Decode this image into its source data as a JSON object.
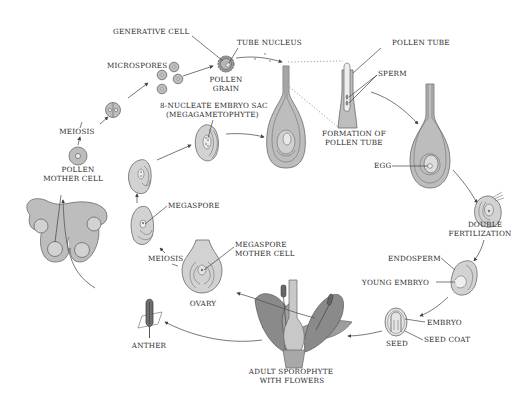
{
  "diagram": {
    "colors": {
      "cell_fill": "#bdbdbd",
      "light_fill": "#d2d2d2",
      "dark_fill": "#8f8f8f",
      "outline": "#6a6a6a",
      "text": "#2a2a2a",
      "background": "#ffffff"
    },
    "labels": {
      "generative_cell": "GENERATIVE CELL",
      "tube_nucleus": "TUBE NUCLEUS",
      "pollen_grain_1": "POLLEN",
      "pollen_grain_2": "GRAIN",
      "microspores": "MICROSPORES",
      "meiosis_male": "MEIOSIS",
      "pollen_mother_cell_1": "POLLEN",
      "pollen_mother_cell_2": "MOTHER CELL",
      "embryo_sac_1": "8-NUCLEATE EMBRYO SAC",
      "embryo_sac_2": "(MEGAGAMETOPHYTE)",
      "pollen_tube": "POLLEN TUBE",
      "sperm": "SPERM",
      "formation_1": "FORMATION OF",
      "formation_2": "POLLEN TUBE",
      "egg": "EGG",
      "double_fert_1": "DOUBLE",
      "double_fert_2": "FERTILIZATION",
      "endosperm": "ENDOSPERM",
      "young_embryo": "YOUNG EMBRYO",
      "embryo": "EMBRYO",
      "seed_coat": "SEED COAT",
      "seed": "SEED",
      "adult_1": "ADULT SPOROPHYTE",
      "adult_2": "WITH FLOWERS",
      "megaspore": "MEGASPORE",
      "meiosis_female": "MEIOSIS",
      "megaspore_mother_1": "MEGASPORE",
      "megaspore_mother_2": "MOTHER CELL",
      "ovary": "OVARY",
      "anther": "ANTHER"
    }
  }
}
